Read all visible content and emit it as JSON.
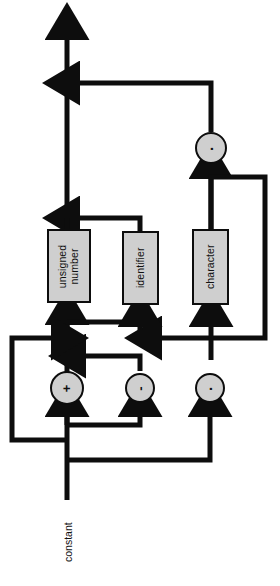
{
  "diagram": {
    "orientation": "rotated-90",
    "entry_label": "constant",
    "colors": {
      "node_fill": "#cfcfcf",
      "stroke": "#0d0d0d",
      "background": "#ffffff"
    },
    "nodes": [
      {
        "id": "unsigned-number",
        "label": "unsigned\nnumber",
        "x": 47,
        "y": 229,
        "w": 44,
        "h": 74
      },
      {
        "id": "identifier",
        "label": "identifier",
        "x": 122,
        "y": 231,
        "w": 37,
        "h": 74
      },
      {
        "id": "character",
        "label": "character",
        "x": 192,
        "y": 229,
        "w": 37,
        "h": 76
      }
    ],
    "operators": [
      {
        "id": "plus-operator",
        "glyph": "+",
        "x": 67,
        "y": 388,
        "r": 17
      },
      {
        "id": "minus-operator",
        "glyph": "-",
        "x": 140,
        "y": 388,
        "r": 15
      },
      {
        "id": "concat-operator",
        "glyph": "·",
        "x": 210,
        "y": 388,
        "r": 15
      },
      {
        "id": "concat-operator-top",
        "glyph": "·",
        "x": 211,
        "y": 148,
        "r": 16
      }
    ]
  }
}
